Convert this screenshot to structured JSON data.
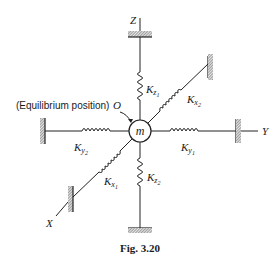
{
  "figure": {
    "caption": "Fig. 3.20",
    "mass_label": "m",
    "origin_label": "O",
    "equilibrium_label": "(Equilibrium position)",
    "axes": {
      "x": "X",
      "y": "Y",
      "z": "Z"
    },
    "springs": [
      {
        "id": "kz1",
        "base": "K",
        "sub": "z",
        "subsub": "1"
      },
      {
        "id": "kz2",
        "base": "K",
        "sub": "z",
        "subsub": "2"
      },
      {
        "id": "ky1",
        "base": "K",
        "sub": "y",
        "subsub": "1"
      },
      {
        "id": "ky2",
        "base": "K",
        "sub": "y",
        "subsub": "2"
      },
      {
        "id": "kx1",
        "base": "K",
        "sub": "x",
        "subsub": "1"
      },
      {
        "id": "kx2",
        "base": "K",
        "sub": "x",
        "subsub": "2"
      }
    ]
  }
}
